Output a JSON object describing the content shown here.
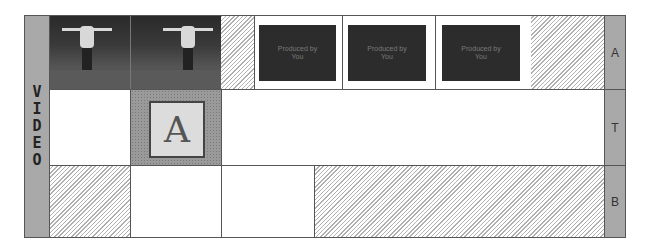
{
  "track_label": {
    "letters": [
      "V",
      "I",
      "D",
      "E",
      "O"
    ]
  },
  "side_labels": {
    "a": "A",
    "t": "T",
    "b": "B"
  },
  "clips": [
    {
      "kind": "video",
      "name": "video-clip-1"
    },
    {
      "kind": "video",
      "name": "video-clip-2"
    },
    {
      "kind": "text",
      "line1": "Produced by",
      "line2": "You"
    },
    {
      "kind": "text",
      "line1": "Produced by",
      "line2": "You"
    },
    {
      "kind": "text",
      "line1": "Produced by",
      "line2": "You"
    }
  ],
  "title_clip": {
    "glyph": "A",
    "overlay": "B"
  },
  "colors": {
    "border": "#555555",
    "label_bg": "#b4b4b4",
    "clip_dark": "#2c2c2c"
  }
}
